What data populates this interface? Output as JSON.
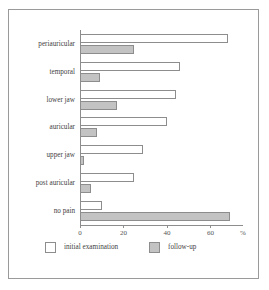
{
  "chart_data": {
    "type": "bar",
    "orientation": "horizontal",
    "title": "",
    "xlabel": "%",
    "ylabel": "",
    "xlim": [
      0,
      75
    ],
    "xticks": [
      0,
      20,
      40,
      60
    ],
    "xtick_labels": [
      "0",
      "20",
      "40",
      "60"
    ],
    "grid": false,
    "legend_position": "bottom",
    "categories": [
      "periauricular",
      "temporal",
      "lower jaw",
      "auricular",
      "upper jaw",
      "post auricular",
      "no pain"
    ],
    "series": [
      {
        "name": "initial examination",
        "color": "#ffffff",
        "edge_color": "#8d8d8d",
        "values": [
          68,
          46,
          44,
          40,
          29,
          25,
          10
        ]
      },
      {
        "name": "follow-up",
        "color": "#c3c3c3",
        "edge_color": "#8d8d8d",
        "values": [
          25,
          9,
          17,
          8,
          2,
          5,
          69
        ]
      }
    ]
  },
  "axis": {
    "unit_label": "%"
  },
  "legend": {
    "entries": [
      {
        "label": "initial examination",
        "swatch": "white-square"
      },
      {
        "label": "follow-up",
        "swatch": "gray-square"
      }
    ]
  },
  "style": {
    "frame_color": "#9a9a9a",
    "axis_color": "#8d8d8d",
    "background": "#ffffff",
    "text_color": "#3f3f3f"
  }
}
